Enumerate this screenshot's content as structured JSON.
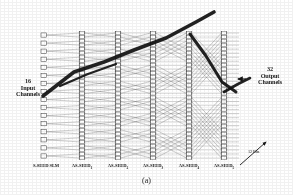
{
  "figure": {
    "caption": "(a)",
    "type": "optical-multistage-interconnection-network",
    "input_label_lines": [
      "16",
      "Input",
      "Channels"
    ],
    "output_label_lines": [
      "32",
      "Output",
      "Channels"
    ],
    "bits_annotation": "12 Bits",
    "stages": [
      {
        "label": "S-SEED SLM",
        "base": "S-SEED SLM",
        "sub": "",
        "x": 46
      },
      {
        "label": "AS-SEED1",
        "base": "AS-SEED",
        "sub": "1",
        "x": 82
      },
      {
        "label": "AS-SEED2",
        "base": "AS-SEED",
        "sub": "2",
        "x": 118
      },
      {
        "label": "AS-SEED3",
        "base": "AS-SEED",
        "sub": "3",
        "x": 153
      },
      {
        "label": "AS-SEED4",
        "base": "AS-SEED",
        "sub": "4",
        "x": 189
      },
      {
        "label": "AS-SEED5",
        "base": "AS-SEED",
        "sub": "5",
        "x": 224
      }
    ],
    "counts": {
      "input_channels": 16,
      "output_channels": 32,
      "device_rows_per_stage": 32,
      "stage_count": 6
    },
    "colors": {
      "ink": "#1a1a1a",
      "line": "#2b2b2b",
      "beam": "#111111",
      "paper": "#ffffff"
    }
  },
  "chart_data": {
    "type": "diagram-network",
    "stage_columns": [
      "S-SEED SLM",
      "AS-SEED1",
      "AS-SEED2",
      "AS-SEED3",
      "AS-SEED4",
      "AS-SEED5"
    ],
    "crossover_spans": [
      1,
      2,
      4,
      8,
      16
    ],
    "inputs": 16,
    "outputs": 32,
    "annotations": [
      "16 Input Channels",
      "32 Output Channels",
      "12 Bits",
      "(a)"
    ]
  }
}
